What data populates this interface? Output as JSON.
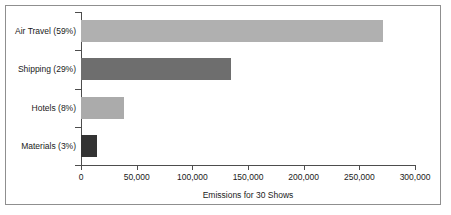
{
  "chart_data": {
    "type": "bar",
    "orientation": "horizontal",
    "title": "",
    "xlabel": "Emissions for 30 Shows",
    "ylabel": "",
    "xlim": [
      0,
      300000
    ],
    "grid": false,
    "legend": "none",
    "categories": [
      "Air Travel (59%)",
      "Shipping (29%)",
      "Hotels (8%)",
      "Materials (3%)"
    ],
    "values": [
      271000,
      135000,
      38600,
      14400
    ],
    "percent_labels": [
      "59%",
      "29%",
      "8%",
      "3%"
    ],
    "bar_colors": [
      "#b0b0b0",
      "#6e6e6e",
      "#ababab",
      "#333333"
    ],
    "xticks": [
      0,
      50000,
      100000,
      150000,
      200000,
      250000,
      300000
    ],
    "xticklabels": [
      "0",
      "50,000",
      "100,000",
      "150,000",
      "200,000",
      "250,000",
      "300,000"
    ]
  },
  "figure": {
    "border_color": "#8f8f8f",
    "axis_color": "#4d4d4d",
    "background": "#ffffff"
  }
}
